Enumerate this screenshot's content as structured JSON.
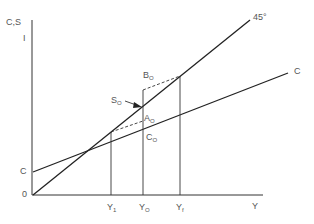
{
  "diagram": {
    "axes": {
      "y_label": "C,S",
      "y_label2": "I",
      "x_label": "Y",
      "origin": "0"
    },
    "lines": {
      "forty_five": "45°",
      "consumption": "C",
      "consumption_intercept": "C"
    },
    "points": {
      "B": {
        "base": "B",
        "sub": "O"
      },
      "S": {
        "base": "S",
        "sub": "O"
      },
      "A": {
        "base": "A",
        "sub": "O"
      },
      "Cpt": {
        "base": "C",
        "sub": "O"
      }
    },
    "x_ticks": {
      "y1": {
        "base": "Y",
        "sub": "1"
      },
      "y0": {
        "base": "Y",
        "sub": "O"
      },
      "yf": {
        "base": "Y",
        "sub": "f"
      }
    },
    "colors": {
      "line": "#222222",
      "label": "#555555"
    }
  }
}
